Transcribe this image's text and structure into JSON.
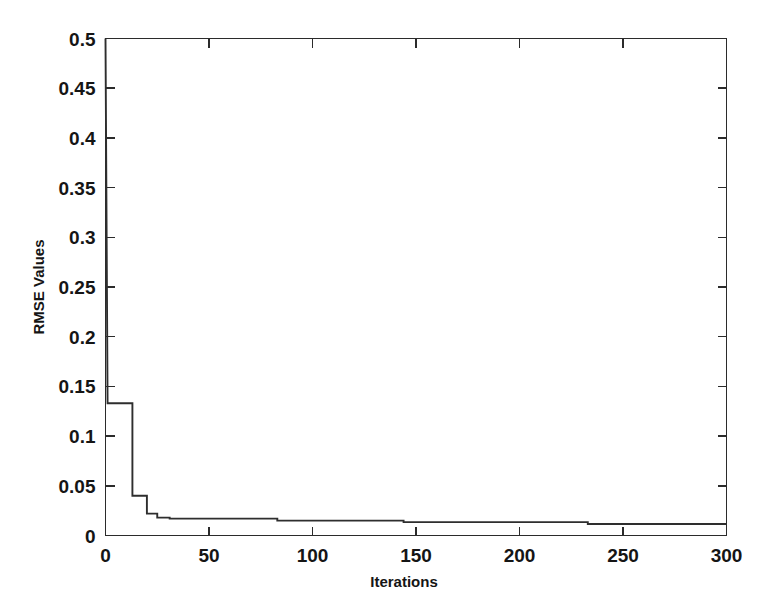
{
  "figure": {
    "background_color": "#ffffff",
    "axis_color": "#2b2b2b",
    "line_color": "#2e2e2e"
  },
  "axes": {
    "ylabel": "RMSE Values",
    "xlabel": "Iterations",
    "y_ticks": [
      "0",
      "0.05",
      "0.1",
      "0.15",
      "0.2",
      "0.25",
      "0.3",
      "0.35",
      "0.4",
      "0.45",
      "0.5"
    ],
    "x_ticks": [
      "0",
      "50",
      "100",
      "150",
      "200",
      "250",
      "300"
    ]
  },
  "chart_data": {
    "type": "line",
    "title": "",
    "xlabel": "Iterations",
    "ylabel": "RMSE Values",
    "xlim": [
      0,
      300
    ],
    "ylim": [
      0,
      0.5
    ],
    "grid": false,
    "legend": null,
    "xticks": [
      0,
      50,
      100,
      150,
      200,
      250,
      300
    ],
    "yticks": [
      0,
      0.05,
      0.1,
      0.15,
      0.2,
      0.25,
      0.3,
      0.35,
      0.4,
      0.45,
      0.5
    ],
    "step_style": "post",
    "annotations": [],
    "series": [
      {
        "name": "RMSE",
        "x": [
          0,
          1,
          13,
          13,
          20,
          20,
          25,
          25,
          31,
          31,
          83,
          83,
          144,
          144,
          233,
          233,
          300
        ],
        "y": [
          0.5,
          0.133,
          0.133,
          0.04,
          0.04,
          0.022,
          0.022,
          0.018,
          0.018,
          0.017,
          0.017,
          0.015,
          0.015,
          0.0135,
          0.0135,
          0.0115,
          0.0115
        ]
      }
    ]
  }
}
